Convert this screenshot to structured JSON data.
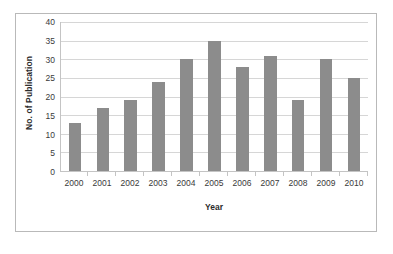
{
  "chart_data": {
    "type": "bar",
    "title": "",
    "xlabel": "Year",
    "ylabel": "No. of Publication",
    "categories": [
      "2000",
      "2001",
      "2002",
      "2003",
      "2004",
      "2005",
      "2006",
      "2007",
      "2008",
      "2009",
      "2010"
    ],
    "values": [
      13,
      17,
      19,
      24,
      30,
      35,
      28,
      31,
      19,
      30,
      25
    ],
    "ylim": [
      0,
      40
    ],
    "ytick_step": 5,
    "yticks": [
      "40",
      "35",
      "30",
      "25",
      "20",
      "15",
      "10",
      "5",
      "0"
    ],
    "grid": true,
    "legend": false,
    "bar_color": "#8c8c8c",
    "gridline_color": "#d6d6d6",
    "axis_color": "#c4c4c4",
    "border_color": "#b9b9b9",
    "background": "#ffffff"
  }
}
